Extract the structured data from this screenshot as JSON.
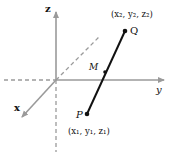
{
  "diagram": {
    "axes": {
      "x_label": "x",
      "y_label": "y",
      "z_label": "z",
      "axis_color": "#9a9a9a"
    },
    "points": {
      "P": {
        "label": "P",
        "coords": "(x₁, y₁, z₁)"
      },
      "Q": {
        "label": "Q",
        "coords": "(x₂, y₂, z₂)"
      },
      "M": {
        "label": "M"
      }
    },
    "segment_color": "#111111"
  }
}
